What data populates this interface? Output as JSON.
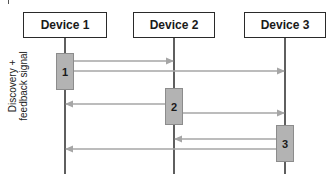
{
  "diagram": {
    "type": "sequence",
    "devices": [
      {
        "label": "Device 1"
      },
      {
        "label": "Device 2"
      },
      {
        "label": "Device 3"
      }
    ],
    "steps": [
      {
        "label": "1",
        "from": "Device 1",
        "to": [
          "Device 2",
          "Device 3"
        ]
      },
      {
        "label": "2",
        "from": "Device 2",
        "to": [
          "Device 1",
          "Device 3"
        ]
      },
      {
        "label": "3",
        "from": "Device 3",
        "to": [
          "Device2",
          "Device 1"
        ]
      }
    ],
    "side_label": "Discovery + feedback signal",
    "colors": {
      "lifeline": "#2a2a2a",
      "arrow": "#a6a6a6",
      "activation_fill": "#b3b3b3",
      "activation_border": "#8c8c8c"
    }
  }
}
